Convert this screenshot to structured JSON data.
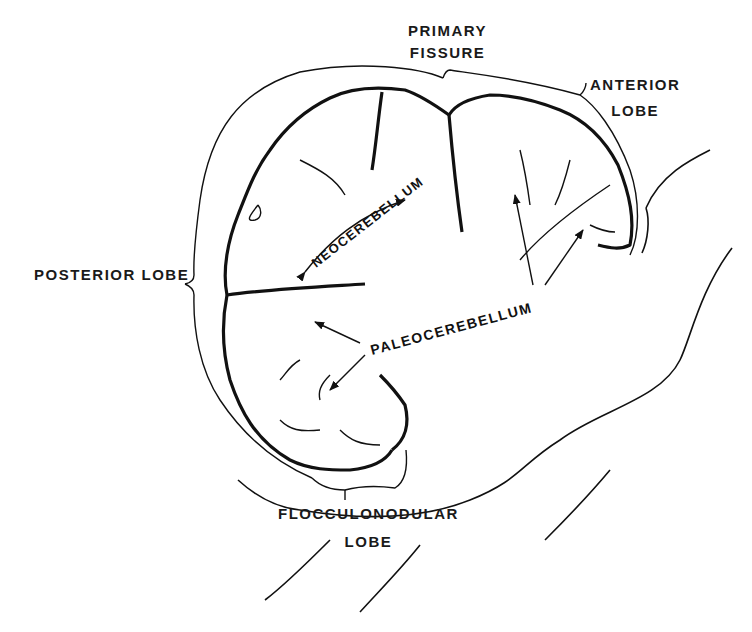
{
  "diagram": {
    "labels": {
      "primary_fissure": [
        "PRIMARY",
        "FISSURE"
      ],
      "anterior_lobe": [
        "ANTERIOR",
        "LOBE"
      ],
      "posterior_lobe": "POSTERIOR LOBE",
      "neocerebellum": "NEOCEREBELLUM",
      "paleocerebellum": "PALEOCEREBELLUM",
      "flocculonodular_lobe": [
        "FLOCCULONODULAR",
        "LOBE"
      ]
    },
    "colors": {
      "ink": "#111111",
      "background": "#ffffff"
    }
  }
}
